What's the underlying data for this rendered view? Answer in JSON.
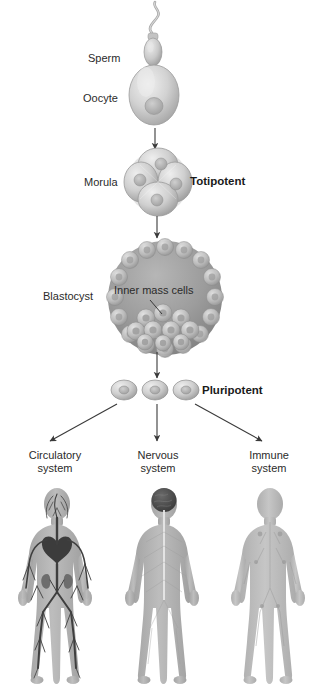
{
  "diagram": {
    "background_color": "#ffffff",
    "text_color": "#2b2b2b",
    "bold_text_color": "#1a1a1a",
    "arrow_color": "#3a3a3a"
  },
  "stages": {
    "sperm": {
      "label": "Sperm"
    },
    "oocyte": {
      "label": "Oocyte"
    },
    "morula": {
      "label": "Morula",
      "potency": "Totipotent",
      "cell_count": 4
    },
    "blastocyst": {
      "label": "Blastocyst",
      "inner_mass": "Inner mass cells"
    },
    "pluripotent": {
      "potency": "Pluripotent",
      "cell_count": 3
    }
  },
  "systems": [
    {
      "line1": "Circulatory",
      "line2": "system",
      "figure": "circulatory-body-figure"
    },
    {
      "line1": "Nervous",
      "line2": "system",
      "figure": "nervous-body-figure"
    },
    {
      "line1": "Immune",
      "line2": "system",
      "figure": "immune-body-figure"
    }
  ],
  "colors": {
    "cell_fill": "#b9b9b9",
    "cell_light": "#dedede",
    "cell_dark": "#8f8f8f",
    "blastocyst_inner": "#9a9a9a",
    "body_fill": "#b0b0b0",
    "vessel_color": "#4a4a4a",
    "brain_color": "#4c4c4c"
  }
}
